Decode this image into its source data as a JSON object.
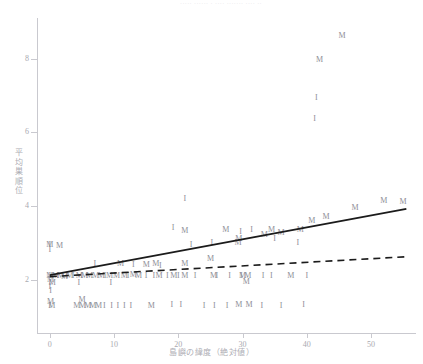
{
  "figure": {
    "top_strip_text": "·····  ······  · ····  ·······  ····  ··"
  },
  "chart_data": {
    "type": "scatter",
    "title": "",
    "xlabel": "島嶼の緯度（絶対値）",
    "ylabel": "平均巣順位",
    "xlim": [
      -2,
      57
    ],
    "ylim": [
      0.55,
      9.1
    ],
    "xticks": [
      0,
      10,
      20,
      30,
      40,
      50
    ],
    "xticklabels": [
      "0",
      "10",
      "20",
      "30",
      "40",
      "50"
    ],
    "yticks": [
      2,
      4,
      6,
      8
    ],
    "yticklabels": [
      "2",
      "4",
      "6",
      "8"
    ],
    "grid": false,
    "legend": "none",
    "marker_labels": {
      "M": "M",
      "I": "I"
    },
    "series": [
      {
        "name": "M",
        "marker": "M",
        "points": [
          [
            0.0,
            2.95
          ],
          [
            1.5,
            2.9
          ],
          [
            0.0,
            2.1
          ],
          [
            0.9,
            2.1
          ],
          [
            1.7,
            2.1
          ],
          [
            2.3,
            2.08
          ],
          [
            3.1,
            2.1
          ],
          [
            4.6,
            2.1
          ],
          [
            5.4,
            2.1
          ],
          [
            6.2,
            2.1
          ],
          [
            7.1,
            2.1
          ],
          [
            8.0,
            2.1
          ],
          [
            9.3,
            2.1
          ],
          [
            10.4,
            2.1
          ],
          [
            11.6,
            2.1
          ],
          [
            13.0,
            2.12
          ],
          [
            13.8,
            2.1
          ],
          [
            17.0,
            2.1
          ],
          [
            19.3,
            2.1
          ],
          [
            21.0,
            2.1
          ],
          [
            25.5,
            2.1
          ],
          [
            30.0,
            2.1
          ],
          [
            30.8,
            2.1
          ],
          [
            37.5,
            2.1
          ],
          [
            0.1,
            1.98
          ],
          [
            0.4,
            1.92
          ],
          [
            30.6,
            1.93
          ],
          [
            0.1,
            1.4
          ],
          [
            5.0,
            1.45
          ],
          [
            0.3,
            1.28
          ],
          [
            4.2,
            1.28
          ],
          [
            5.1,
            1.28
          ],
          [
            5.9,
            1.28
          ],
          [
            6.7,
            1.28
          ],
          [
            7.6,
            1.28
          ],
          [
            15.8,
            1.28
          ],
          [
            29.4,
            1.3
          ],
          [
            31.0,
            1.3
          ],
          [
            16.5,
            2.42
          ],
          [
            21.0,
            2.43
          ],
          [
            25.0,
            2.55
          ],
          [
            21.0,
            3.33
          ],
          [
            27.4,
            3.35
          ],
          [
            29.4,
            3.1
          ],
          [
            29.3,
            2.98
          ],
          [
            36.0,
            3.27
          ],
          [
            39.0,
            3.35
          ],
          [
            40.8,
            3.6
          ],
          [
            43.0,
            3.7
          ],
          [
            47.5,
            3.95
          ],
          [
            52.0,
            4.12
          ],
          [
            55.0,
            4.1
          ],
          [
            42.0,
            7.95
          ],
          [
            45.5,
            8.62
          ],
          [
            33.4,
            3.22
          ],
          [
            11.0,
            2.42
          ],
          [
            15.0,
            2.4
          ],
          [
            34.5,
            3.35
          ]
        ]
      },
      {
        "name": "I",
        "marker": "I",
        "points": [
          [
            0.0,
            2.93
          ],
          [
            0.0,
            2.8
          ],
          [
            7.0,
            2.42
          ],
          [
            13.0,
            2.4
          ],
          [
            17.2,
            2.38
          ],
          [
            0.0,
            2.1
          ],
          [
            1.2,
            2.1
          ],
          [
            2.6,
            2.1
          ],
          [
            3.6,
            2.1
          ],
          [
            5.0,
            2.1
          ],
          [
            8.6,
            2.1
          ],
          [
            12.2,
            2.1
          ],
          [
            15.0,
            2.1
          ],
          [
            16.2,
            2.1
          ],
          [
            18.3,
            2.1
          ],
          [
            20.0,
            2.1
          ],
          [
            22.6,
            2.1
          ],
          [
            26.0,
            2.1
          ],
          [
            28.0,
            2.1
          ],
          [
            29.8,
            2.1
          ],
          [
            33.2,
            2.1
          ],
          [
            34.5,
            2.1
          ],
          [
            40.0,
            2.1
          ],
          [
            0.0,
            1.92
          ],
          [
            0.0,
            1.8
          ],
          [
            4.5,
            1.9
          ],
          [
            9.5,
            1.9
          ],
          [
            0.1,
            1.7
          ],
          [
            0.0,
            1.28
          ],
          [
            8.5,
            1.28
          ],
          [
            9.6,
            1.28
          ],
          [
            10.6,
            1.28
          ],
          [
            11.6,
            1.28
          ],
          [
            12.6,
            1.28
          ],
          [
            19.0,
            1.3
          ],
          [
            20.4,
            1.3
          ],
          [
            24.0,
            1.28
          ],
          [
            25.6,
            1.28
          ],
          [
            27.6,
            1.28
          ],
          [
            33.0,
            1.28
          ],
          [
            36.0,
            1.28
          ],
          [
            39.5,
            1.3
          ],
          [
            21.0,
            4.18
          ],
          [
            29.7,
            3.3
          ],
          [
            31.4,
            3.35
          ],
          [
            35.0,
            3.1
          ],
          [
            25.2,
            2.98
          ],
          [
            38.6,
            3.0
          ],
          [
            41.2,
            6.35
          ],
          [
            41.5,
            6.92
          ],
          [
            22.0,
            2.95
          ],
          [
            19.2,
            3.4
          ]
        ]
      }
    ],
    "fit_lines": [
      {
        "name": "solid-fit",
        "style": "solid",
        "x0": 0,
        "y0": 2.12,
        "x1": 55.5,
        "y1": 3.92
      },
      {
        "name": "dashed-fit",
        "style": "dashed",
        "x0": 0,
        "y0": 2.08,
        "x1": 55.5,
        "y1": 2.62
      }
    ]
  }
}
